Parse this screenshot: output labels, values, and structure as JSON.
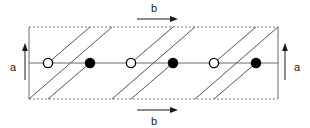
{
  "figure": {
    "background_color": "#ffffff"
  },
  "axes": {
    "vertical_left": {
      "label": "a",
      "icon": "arrow-up-icon",
      "direction": "up",
      "label_x": 13,
      "label_y": 71,
      "arrow_x": 25,
      "arrow_y_start": 80,
      "arrow_y_end": 46
    },
    "vertical_right": {
      "label": "a",
      "icon": "arrow-up-icon",
      "direction": "up",
      "label_x": 297,
      "label_y": 71,
      "arrow_x": 285,
      "arrow_y_start": 80,
      "arrow_y_end": 46
    },
    "horizontal_top": {
      "label": "b",
      "icon": "arrow-right-icon",
      "direction": "right",
      "label_x": 154,
      "label_y": 11,
      "arrow_y": 19,
      "arrow_x_start": 137,
      "arrow_x_end": 176
    },
    "horizontal_bottom": {
      "label": "b",
      "icon": "arrow-right-icon",
      "direction": "right",
      "label_x": 154,
      "label_y": 124,
      "arrow_y": 110,
      "arrow_x_start": 137,
      "arrow_x_end": 176
    }
  },
  "cell": {
    "left": 29,
    "right": 278,
    "top": 27,
    "bottom": 99,
    "edge_color": "#6b6b6b",
    "dashed_edge_color": "#7a7a7a",
    "dash_pattern": "2,2",
    "top_edge_style": "dashed",
    "bottom_edge_style": "dashed",
    "left_edge_style": "solid",
    "right_edge_style": "solid",
    "stroke_width": 1
  },
  "midline": {
    "y": 63,
    "x_start": 29,
    "x_end": 278,
    "color": "#6b6b6b",
    "stroke_width": 1
  },
  "atoms": {
    "radius": 4.6,
    "open_fill": "#ffffff",
    "filled_fill": "#000000",
    "stroke": "#000000",
    "stroke_width": 1.3,
    "items": [
      {
        "name": "atom-open-1",
        "type": "open",
        "cx": 48,
        "cy": 63
      },
      {
        "name": "atom-filled-1",
        "type": "filled",
        "cx": 90,
        "cy": 63
      },
      {
        "name": "atom-open-2",
        "type": "open",
        "cx": 131,
        "cy": 63
      },
      {
        "name": "atom-filled-2",
        "type": "filled",
        "cx": 173,
        "cy": 63
      },
      {
        "name": "atom-open-3",
        "type": "open",
        "cx": 214,
        "cy": 63
      },
      {
        "name": "atom-filled-3",
        "type": "filled",
        "cx": 256,
        "cy": 63
      }
    ]
  },
  "diagonals": {
    "color": "#555555",
    "stroke_width": 1,
    "lines": [
      {
        "name": "diagonal-line-1",
        "x1": 29,
        "y1": 99,
        "x2": 112,
        "y2": 27
      },
      {
        "name": "diagonal-line-2",
        "x1": 112,
        "y1": 99,
        "x2": 195,
        "y2": 27
      },
      {
        "name": "diagonal-line-3",
        "x1": 195,
        "y1": 99,
        "x2": 278,
        "y2": 27
      },
      {
        "name": "diagonal-line-4",
        "x1": 48,
        "y1": 63,
        "x2": 90,
        "y2": 27
      },
      {
        "name": "diagonal-line-5",
        "x1": 131,
        "y1": 63,
        "x2": 173,
        "y2": 27
      },
      {
        "name": "diagonal-line-6",
        "x1": 214,
        "y1": 63,
        "x2": 256,
        "y2": 27
      },
      {
        "name": "diagonal-line-7",
        "x1": 48,
        "y1": 99,
        "x2": 90,
        "y2": 63
      },
      {
        "name": "diagonal-line-8",
        "x1": 131,
        "y1": 99,
        "x2": 173,
        "y2": 63
      },
      {
        "name": "diagonal-line-9",
        "x1": 214,
        "y1": 99,
        "x2": 256,
        "y2": 63
      }
    ]
  }
}
